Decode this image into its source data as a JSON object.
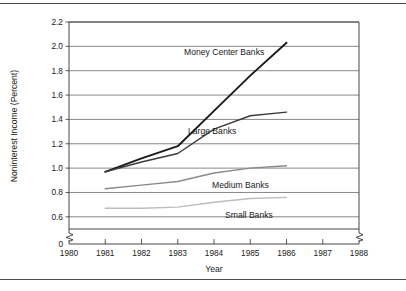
{
  "chart_data": {
    "type": "line",
    "title": "",
    "xlabel": "Year",
    "ylabel": "Noninterest Income (Percent)",
    "xlim": [
      1980,
      1988
    ],
    "ylim": [
      0.5,
      2.2
    ],
    "y_axis_break": true,
    "y_break_label": "0",
    "x_axis_break": true,
    "grid": true,
    "legend": "inline-annotations",
    "xticks": [
      "1980",
      "1981",
      "1982",
      "1983",
      "1984",
      "1985",
      "1986",
      "1987",
      "1988"
    ],
    "yticks": [
      "2.2",
      "2.0",
      "1.8",
      "1.6",
      "1.4",
      "1.2",
      "1.0",
      "0.8",
      "0.6"
    ],
    "x": [
      1981,
      1982,
      1983,
      1984,
      1985,
      1986
    ],
    "series": [
      {
        "name": "Money Center Banks",
        "values": [
          0.97,
          1.08,
          1.18,
          1.47,
          1.76,
          2.03
        ],
        "color": "#1a1a1a",
        "width": 1.9
      },
      {
        "name": "Large Banks",
        "values": [
          0.97,
          1.05,
          1.12,
          1.32,
          1.43,
          1.46
        ],
        "color": "#3a3a3a",
        "width": 1.4
      },
      {
        "name": "Medium Banks",
        "values": [
          0.83,
          0.86,
          0.89,
          0.96,
          1.0,
          1.02
        ],
        "color": "#8a8a8a",
        "width": 1.4
      },
      {
        "name": "Small Banks",
        "values": [
          0.67,
          0.67,
          0.68,
          0.72,
          0.75,
          0.76
        ],
        "color": "#bcbcbc",
        "width": 1.4
      }
    ],
    "annotations": [
      {
        "text": "Money Center Banks",
        "x": 184,
        "y": 55
      },
      {
        "text": "Large Banks",
        "x": 188,
        "y": 134
      },
      {
        "text": "Medium Banks",
        "x": 212,
        "y": 188
      },
      {
        "text": "Small Banks",
        "x": 225,
        "y": 218
      }
    ]
  }
}
